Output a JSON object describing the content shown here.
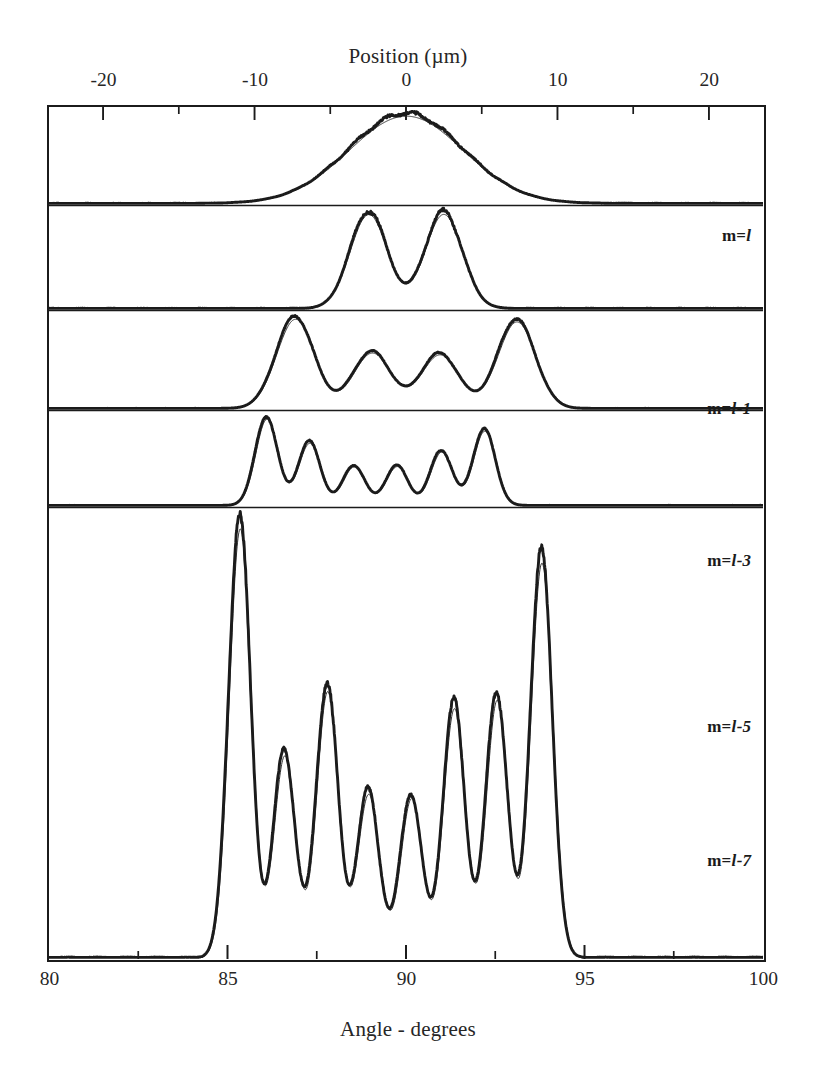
{
  "figure": {
    "top_axis": {
      "title": "Position (µm)",
      "min": -23.57,
      "max": 23.57,
      "ticks_major": [
        -20,
        -10,
        0,
        10,
        20
      ],
      "tick_labels": [
        "-20",
        "-10",
        "0",
        "10",
        "20"
      ],
      "ticks_minor": [
        -15,
        -5,
        5,
        15
      ]
    },
    "bottom_axis": {
      "title": "Angle - degrees",
      "min": 80,
      "max": 100,
      "ticks_major": [
        85,
        90,
        95
      ],
      "tick_labels": [
        "80",
        "85",
        "90",
        "95",
        "100"
      ],
      "tick_labels_all": [
        80,
        85,
        90,
        95,
        100
      ],
      "ticks_minor": [
        82.5,
        87.5,
        92.5,
        97.5
      ]
    },
    "panels": [
      {
        "label_prefix": "m=",
        "label_italic": "l",
        "label_suffix": ""
      },
      {
        "label_prefix": "m=",
        "label_italic": "l",
        "label_suffix": "-1"
      },
      {
        "label_prefix": "m=",
        "label_italic": "l",
        "label_suffix": "-3"
      },
      {
        "label_prefix": "m=",
        "label_italic": "l",
        "label_suffix": "-5"
      },
      {
        "label_prefix": "m=",
        "label_italic": "l",
        "label_suffix": "-7"
      }
    ],
    "colors": {
      "frame": "#1b1b1b",
      "experiment_curve": "#1b1b1b",
      "theory_curve": "#333333",
      "background": "#ffffff"
    },
    "legend_note": {
      "thick": "experiment",
      "thin": "theory"
    }
  },
  "chart_data": {
    "type": "line",
    "title": "",
    "xlabel": "Angle - degrees",
    "ylabel": "",
    "xlim": [
      80,
      100
    ],
    "grid": false,
    "legend": "none",
    "secondary_xaxis": {
      "label": "Position (µm)",
      "lim": [
        -23.57,
        23.57
      ]
    },
    "panel_count": 5,
    "panels": [
      {
        "name": "m=l",
        "label": "m=l",
        "series": [
          {
            "name": "experiment",
            "style": "thick"
          },
          {
            "name": "theory",
            "style": "thin"
          }
        ],
        "n_fringes": 1,
        "peak_centers_deg": [
          90.0
        ],
        "peak_heights": [
          1.0
        ],
        "envelope_center_deg": 90.0,
        "envelope_sigma_deg": 2.05,
        "fringe_period_deg": 0.0
      },
      {
        "name": "m=l-1",
        "label": "m=l-1",
        "series": [
          {
            "name": "experiment",
            "style": "thick"
          },
          {
            "name": "theory",
            "style": "thin"
          }
        ],
        "n_fringes": 2,
        "peak_centers_deg": [
          88.95,
          91.05
        ],
        "peak_heights": [
          1.0,
          1.0
        ],
        "envelope_center_deg": 90.0,
        "envelope_sigma_deg": 2.1,
        "fringe_period_deg": 2.1
      },
      {
        "name": "m=l-3",
        "label": "m=l-3",
        "series": [
          {
            "name": "experiment",
            "style": "thick"
          },
          {
            "name": "theory",
            "style": "thin"
          }
        ],
        "n_fringes": 4,
        "peak_centers_deg": [
          86.9,
          89.05,
          90.95,
          93.1
        ],
        "peak_heights": [
          1.0,
          0.62,
          0.6,
          0.97
        ],
        "envelope_center_deg": 90.0,
        "envelope_sigma_deg": 2.55,
        "fringe_period_deg": 2.07
      },
      {
        "name": "m=l-5",
        "label": "m=l-5",
        "series": [
          {
            "name": "experiment",
            "style": "thick"
          },
          {
            "name": "theory",
            "style": "thin"
          }
        ],
        "n_fringes": 6,
        "peak_centers_deg": [
          86.1,
          87.3,
          88.55,
          89.75,
          91.0,
          92.2
        ],
        "peak_heights": [
          1.0,
          0.72,
          0.45,
          0.45,
          0.62,
          0.86
        ],
        "envelope_center_deg": 89.2,
        "envelope_sigma_deg": 2.3,
        "fringe_period_deg": 1.22
      },
      {
        "name": "m=l-7",
        "label": "m=l-7",
        "series": [
          {
            "name": "experiment",
            "style": "thick"
          },
          {
            "name": "theory",
            "style": "thin"
          }
        ],
        "n_fringes": 8,
        "peak_centers_deg": [
          85.35,
          86.6,
          87.8,
          88.95,
          90.15,
          91.35,
          92.55,
          93.8
        ],
        "peak_heights": [
          1.0,
          0.47,
          0.62,
          0.38,
          0.37,
          0.58,
          0.6,
          0.92
        ],
        "envelope_center_deg": 89.3,
        "envelope_sigma_deg": 3.0,
        "fringe_period_deg": 1.2
      }
    ]
  }
}
